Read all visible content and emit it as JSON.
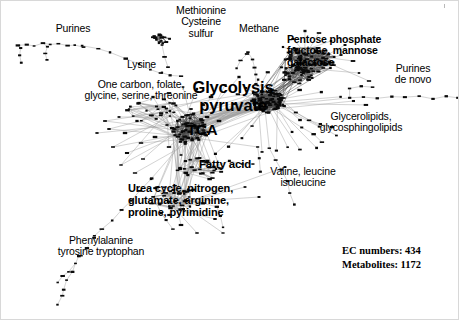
{
  "figure": {
    "kind": "metabolic-network-graph",
    "background_color": "#ffffff",
    "node_color": "#000000",
    "edge_color": "#8d8d8d",
    "width": 459,
    "height": 320
  },
  "labels": {
    "purines": "Purines",
    "methionine_1": "Methionine",
    "methionine_2": "Cysteine",
    "methionine_3": "sulfur",
    "methane": "Methane",
    "pentose_1": "Pentose phosphate",
    "pentose_2": "fructose, mannose",
    "pentose_3": "galactose",
    "purines_denovo_1": "Purines",
    "purines_denovo_2": "de novo",
    "lysine": "Lysine",
    "onecarbon_1": "One carbon, folate,",
    "onecarbon_2": "glycine, serine, threonine",
    "glycolysis_1": "Glycolysis",
    "glycolysis_2": "pyruvate",
    "tca": "TCA",
    "glycerolipids_1": "Glycerolipids,",
    "glycerolipids_2": "glycosphingolipids",
    "fatty_acid": "Fatty acid",
    "valine_1": "Valine, leucine",
    "valine_2": "isoleucine",
    "urea_1": "Urea cycle, nitrogen,",
    "urea_2": "glutamate, arginine,",
    "urea_3": "proline, pyrimidine",
    "phenylalanine_1": "Phenylalanine",
    "phenylalanine_2": "tyrosine tryptophan"
  },
  "stats": {
    "ec_numbers": "EC numbers: 434",
    "metabolites": "Metabolites: 1172"
  },
  "chart_data": {
    "type": "scatter",
    "xlabel": "",
    "ylabel": "",
    "ec_numbers": 434,
    "metabolites": 1172,
    "modules": [
      {
        "name": "Purines",
        "label_x": 72,
        "label_y": 26,
        "hub_x": 60,
        "hub_y": 46,
        "bold": false
      },
      {
        "name": "Methionine Cysteine sulfur",
        "label_x": 200,
        "label_y": 8,
        "hub_x": 163,
        "hub_y": 40,
        "bold": false
      },
      {
        "name": "Methane",
        "label_x": 258,
        "label_y": 26,
        "hub_x": 248,
        "hub_y": 52,
        "bold": false
      },
      {
        "name": "Pentose phosphate fructose, mannose galactose",
        "label_x": 288,
        "label_y": 36,
        "hub_x": 310,
        "hub_y": 58,
        "bold": true
      },
      {
        "name": "Purines de novo",
        "label_x": 397,
        "label_y": 62,
        "hub_x": 400,
        "hub_y": 97,
        "bold": false
      },
      {
        "name": "Lysine",
        "label_x": 128,
        "label_y": 61,
        "hub_x": 160,
        "hub_y": 72,
        "bold": false
      },
      {
        "name": "One carbon, folate, glycine, serine, threonine",
        "label_x": 70,
        "label_y": 82,
        "hub_x": 150,
        "hub_y": 105,
        "bold": false
      },
      {
        "name": "Glycolysis pyruvate",
        "label_x": 183,
        "label_y": 80,
        "hub_x": 215,
        "hub_y": 108,
        "bold": true
      },
      {
        "name": "TCA",
        "label_x": 193,
        "label_y": 125,
        "hub_x": 185,
        "hub_y": 133,
        "bold": true
      },
      {
        "name": "Glycerolipids, glycosphingolipids",
        "label_x": 312,
        "label_y": 108,
        "hub_x": 300,
        "hub_y": 105,
        "bold": false
      },
      {
        "name": "Fatty acid",
        "label_x": 199,
        "label_y": 158,
        "hub_x": 205,
        "hub_y": 163,
        "bold": true
      },
      {
        "name": "Valine, leucine isoleucine",
        "label_x": 268,
        "label_y": 166,
        "hub_x": 290,
        "hub_y": 196,
        "bold": false
      },
      {
        "name": "Urea cycle, nitrogen, glutamate, arginine, proline, pyrimidine",
        "label_x": 126,
        "label_y": 184,
        "hub_x": 168,
        "hub_y": 196,
        "bold": true
      },
      {
        "name": "Phenylalanine tyrosine tryptophan",
        "label_x": 50,
        "label_y": 236,
        "hub_x": 80,
        "hub_y": 270,
        "bold": false
      }
    ]
  }
}
